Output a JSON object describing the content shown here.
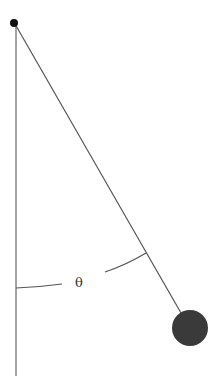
{
  "diagram": {
    "angle_label": "θ",
    "pivot": {
      "x": 14,
      "y": 23
    },
    "bob": {
      "x": 190,
      "y": 328,
      "r": 18,
      "color": "#3a3a3a"
    },
    "line_color": "#555555"
  }
}
